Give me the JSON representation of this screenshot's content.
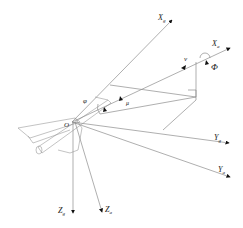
{
  "diagram": {
    "type": "coordinate-axes-aircraft",
    "origin_label": "O",
    "colors": {
      "line": "#9a9a9a",
      "axis": "#8c8c8c",
      "text": "#222222",
      "arrow": "#111111"
    },
    "axes": [
      {
        "id": "Xg",
        "main": "X",
        "sub": "g"
      },
      {
        "id": "Xa",
        "main": "X",
        "sub": "a"
      },
      {
        "id": "Yg",
        "main": "Y",
        "sub": "g"
      },
      {
        "id": "Ya",
        "main": "Y",
        "sub": "a"
      },
      {
        "id": "Zg",
        "main": "Z",
        "sub": "g"
      },
      {
        "id": "Za",
        "main": "Z",
        "sub": "a"
      }
    ],
    "angles": [
      {
        "id": "phi",
        "label": "φ"
      },
      {
        "id": "mu",
        "label": "μ"
      },
      {
        "id": "Phi",
        "label": "Φ"
      }
    ],
    "vectors": [
      {
        "id": "v",
        "label": "v"
      }
    ]
  }
}
